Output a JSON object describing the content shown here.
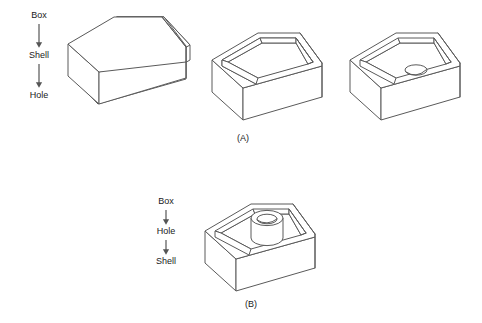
{
  "figure": {
    "background_color": "#ffffff",
    "line_color": "#5a5a5a",
    "text_color": "#1a1a1a"
  },
  "panels": [
    {
      "id": "A",
      "caption": "(A)",
      "flow": {
        "steps": [
          "Box",
          "Shell",
          "Hole"
        ],
        "arrow_glyph": "down-arrow"
      },
      "stages": [
        {
          "name": "box-chamfered-solid",
          "description": "Solid rectangular block with chamfered right end"
        },
        {
          "name": "shelled-box",
          "description": "Same block shelled to an open-top thin-walled tray"
        },
        {
          "name": "shelled-box-with-hole",
          "description": "Shelled tray with a hole cut in the inner floor near the chamfer"
        }
      ]
    },
    {
      "id": "B",
      "caption": "(B)",
      "flow": {
        "steps": [
          "Box",
          "Hole",
          "Shell"
        ],
        "arrow_glyph": "down-arrow"
      },
      "stages": [
        {
          "name": "shelled-box-with-cylindrical-boss",
          "description": "Shelled tray where the earlier hole becomes a raised cylindrical boss with a through hole"
        }
      ]
    }
  ]
}
